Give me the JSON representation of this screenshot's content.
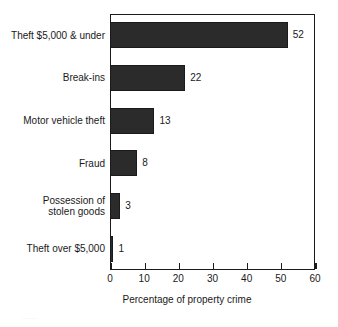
{
  "chart_data": {
    "type": "bar",
    "orientation": "horizontal",
    "title": "",
    "xlabel": "Percentage of property crime",
    "ylabel": "",
    "xlim": [
      0,
      60
    ],
    "xticks": [
      0,
      10,
      20,
      30,
      40,
      50,
      60
    ],
    "grid": false,
    "legend": null,
    "bar_color": "#2b2b2b",
    "categories": [
      "Theft $5,000 & under",
      "Break-ins",
      "Motor vehicle theft",
      "Fraud",
      "Possession of\nstolen goods",
      "Theft over $5,000"
    ],
    "values": [
      52,
      22,
      13,
      8,
      3,
      1
    ],
    "value_labels": [
      "52",
      "22",
      "13",
      "8",
      "3",
      "1"
    ],
    "tick_labels": [
      "0",
      "10",
      "20",
      "30",
      "40",
      "50",
      "60"
    ]
  },
  "footer": {
    "artifact_text": "········"
  }
}
